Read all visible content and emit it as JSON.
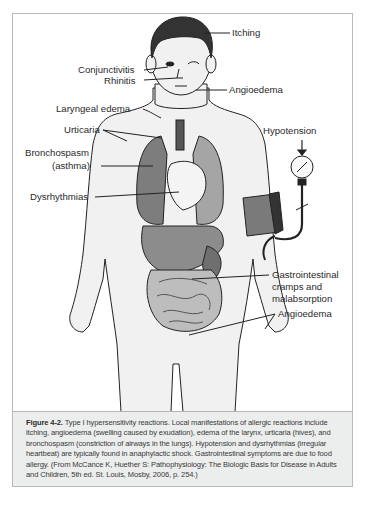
{
  "figure": {
    "number": "Figure 4-2.",
    "caption": " Type I hypersensitivity reactions. Local manifestations of allergic reactions include itching, angioedema (swelling caused by exudation), edema of the larynx, urticaria (hives), and bronchospasm (constriction of airways in the lungs). Hypotension and dysrhythmias (irregular heartbeat) are typically found in anaphylactic shock. Gastrointestinal symptoms are due to food allergy. (From McCance K, Huether S: Pathophysiology: The Biologic Basis for Disease in Adults and Children, 5th ed. St. Louis, Mosby, 2006, p. 254.)"
  },
  "labels": {
    "itching": "Itching",
    "conjunctivitis": "Conjunctivitis",
    "rhinitis": "Rhinitis",
    "angioedema_face": "Angioedema",
    "laryngeal_edema": "Laryngeal edema",
    "urticaria": "Urticaria",
    "hypotension": "Hypotension",
    "bronchospasm_line1": "Bronchospasm",
    "bronchospasm_line2": "(asthma)",
    "dysrhythmias": "Dysrhythmias",
    "gi_line1": "Gastrointestinal",
    "gi_line2": "cramps and",
    "gi_line3": "malabsorption",
    "angioedema_body": "Angioedema"
  },
  "colors": {
    "frame_border": "#b9b9b9",
    "caption_bg": "#eceded",
    "skin": "#f1f1f1",
    "organ_dark": "#8a8a8a",
    "organ_mid": "#a8a8a8",
    "hair": "#333333"
  }
}
